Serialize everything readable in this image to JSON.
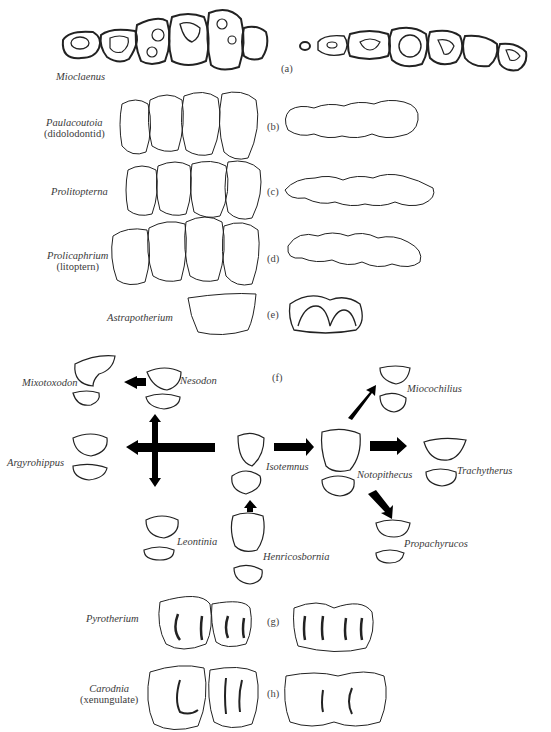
{
  "figure": {
    "panels": [
      {
        "id": "a",
        "tag": "(a)",
        "taxon": "Mioclaenus",
        "note": ""
      },
      {
        "id": "b",
        "tag": "(b)",
        "taxon": "Paulacoutoia",
        "note": "(didolodontid)"
      },
      {
        "id": "c",
        "tag": "(c)",
        "taxon": "Prolitopterna",
        "note": ""
      },
      {
        "id": "d",
        "tag": "(d)",
        "taxon": "Prolicaphrium",
        "note": "(litoptern)"
      },
      {
        "id": "e",
        "tag": "(e)",
        "taxon": "Astrapotherium",
        "note": ""
      },
      {
        "id": "f",
        "tag": "(f)",
        "taxon": "",
        "note": ""
      },
      {
        "id": "g",
        "tag": "(g)",
        "taxon": "Pyrotherium",
        "note": ""
      },
      {
        "id": "h",
        "tag": "(h)",
        "taxon": "Carodnia",
        "note": "(xenungulate)"
      }
    ],
    "panel_f_taxa": [
      "Mixotoxodon",
      "Nesodon",
      "Argyrohippus",
      "Isotemnus",
      "Leontinia",
      "Henricosbornia",
      "Notopithecus",
      "Miocochilius",
      "Trachytherus",
      "Propachyrucos"
    ],
    "panel_f_arrows": [
      {
        "from": "Nesodon",
        "to": "Mixotoxodon"
      },
      {
        "from": "Isotemnus",
        "to": "Argyrohippus"
      },
      {
        "from": "Argyrohippus-junction",
        "to": "Nesodon"
      },
      {
        "from": "Argyrohippus-junction",
        "to": "Leontinia"
      },
      {
        "from": "Henricosbornia",
        "to": "Isotemnus"
      },
      {
        "from": "Isotemnus",
        "to": "Notopithecus"
      },
      {
        "from": "Notopithecus",
        "to": "Miocochilius"
      },
      {
        "from": "Notopithecus",
        "to": "Trachytherus"
      },
      {
        "from": "Notopithecus",
        "to": "Propachyrucos"
      }
    ]
  }
}
